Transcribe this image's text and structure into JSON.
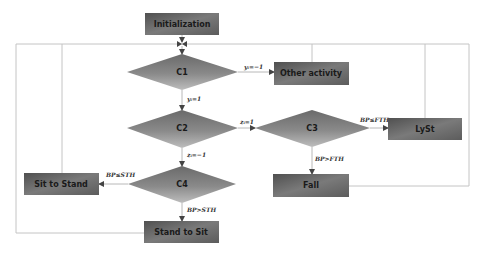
{
  "diagram": {
    "type": "flowchart",
    "colors": {
      "box_dark": "#555555",
      "box_light": "#8c8c8c",
      "diamond_dark": "#6e6e6e",
      "diamond_light": "#b8b8b8",
      "connector": "#c4c4c4",
      "arrowhead": "#444444"
    },
    "nodes": {
      "init": {
        "label": "Initialization",
        "shape": "process"
      },
      "c1": {
        "label": "C1",
        "shape": "decision"
      },
      "c2": {
        "label": "C2",
        "shape": "decision"
      },
      "c3": {
        "label": "C3",
        "shape": "decision"
      },
      "c4": {
        "label": "C4",
        "shape": "decision"
      },
      "other": {
        "label": "Other activity",
        "shape": "process"
      },
      "lyst": {
        "label": "LySt",
        "shape": "process"
      },
      "fall": {
        "label": "Fall",
        "shape": "process"
      },
      "sit_to_stand": {
        "label": "Sit to Stand",
        "shape": "process"
      },
      "stand_to_sit": {
        "label": "Stand to Sit",
        "shape": "process"
      }
    },
    "edges": {
      "c1_other": {
        "from": "C1",
        "to": "Other activity",
        "label": "yᵢ=−1"
      },
      "c1_c2": {
        "from": "C1",
        "to": "C2",
        "label": "yᵢ=1"
      },
      "c2_c3": {
        "from": "C2",
        "to": "C3",
        "label": "zᵢ=1"
      },
      "c2_c4": {
        "from": "C2",
        "to": "C4",
        "label": "zᵢ=−1"
      },
      "c3_lyst": {
        "from": "C3",
        "to": "LySt",
        "label": "BP≤FTH"
      },
      "c3_fall": {
        "from": "C3",
        "to": "Fall",
        "label": "BP>FTH"
      },
      "c4_sit_to_stand": {
        "from": "C4",
        "to": "Sit to Stand",
        "label": "BP≤STH"
      },
      "c4_stand_to_sit": {
        "from": "C4",
        "to": "Stand to Sit",
        "label": "BP>STH"
      }
    }
  }
}
